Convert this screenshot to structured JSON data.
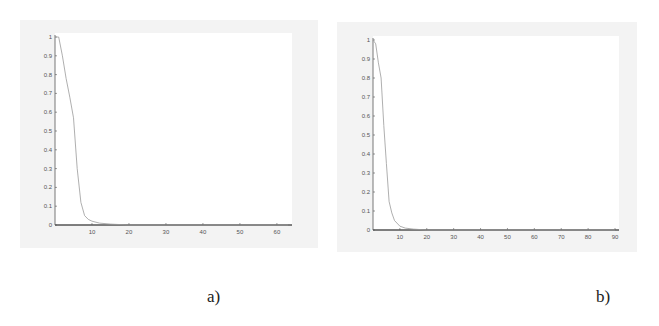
{
  "captions": {
    "a": "a)",
    "b": "b)"
  },
  "colors": {
    "background": "#f3f3f3",
    "plot_area": "#ffffff",
    "axis": "#555555",
    "curve": "#9a9a9a"
  },
  "chart_data": [
    {
      "id": "a",
      "type": "line",
      "title": "",
      "xlabel": "",
      "ylabel": "",
      "xlim": [
        0,
        63
      ],
      "ylim": [
        0,
        1
      ],
      "grid": false,
      "legend": null,
      "x_ticks": [
        10,
        20,
        30,
        40,
        50,
        60
      ],
      "y_ticks": [
        0,
        0.1,
        0.2,
        0.3,
        0.4,
        0.5,
        0.6,
        0.7,
        0.8,
        0.9,
        1
      ],
      "x_tick_labels": [
        "10",
        "20",
        "30",
        "40",
        "50",
        "60"
      ],
      "y_tick_labels": [
        "0",
        "0.1",
        "0.2",
        "0.3",
        "0.4",
        "0.5",
        "0.6",
        "0.7",
        "0.8",
        "0.9",
        "1"
      ],
      "series": [
        {
          "name": "curve",
          "x": [
            0,
            1,
            2,
            3,
            4,
            5,
            6,
            7,
            8,
            9,
            10,
            12,
            15,
            20,
            30,
            40,
            50,
            60,
            63
          ],
          "y": [
            1.0,
            1.0,
            0.9,
            0.78,
            0.68,
            0.57,
            0.3,
            0.12,
            0.05,
            0.03,
            0.02,
            0.01,
            0.005,
            0.0,
            0.0,
            0.0,
            0.0,
            0.0,
            0.0
          ]
        }
      ]
    },
    {
      "id": "b",
      "type": "line",
      "title": "",
      "xlabel": "",
      "ylabel": "",
      "xlim": [
        0,
        90
      ],
      "ylim": [
        0,
        1
      ],
      "grid": false,
      "legend": null,
      "x_ticks": [
        10,
        20,
        30,
        40,
        50,
        60,
        70,
        80,
        90
      ],
      "y_ticks": [
        0,
        0.1,
        0.2,
        0.3,
        0.4,
        0.5,
        0.6,
        0.7,
        0.8,
        0.9,
        1
      ],
      "x_tick_labels": [
        "10",
        "20",
        "30",
        "40",
        "50",
        "60",
        "70",
        "80",
        "90"
      ],
      "y_tick_labels": [
        "0",
        "0.1",
        "0.2",
        "0.3",
        "0.4",
        "0.5",
        "0.6",
        "0.7",
        "0.8",
        "0.9",
        "1"
      ],
      "series": [
        {
          "name": "curve",
          "x": [
            0,
            1,
            2,
            3,
            4,
            5,
            6,
            7,
            8,
            10,
            12,
            15,
            20,
            30,
            40,
            50,
            60,
            70,
            80,
            90
          ],
          "y": [
            1.0,
            0.98,
            0.88,
            0.8,
            0.55,
            0.35,
            0.15,
            0.09,
            0.05,
            0.02,
            0.01,
            0.005,
            0.0,
            0.0,
            0.0,
            0.0,
            0.0,
            0.0,
            0.0,
            0.0
          ]
        }
      ]
    }
  ]
}
